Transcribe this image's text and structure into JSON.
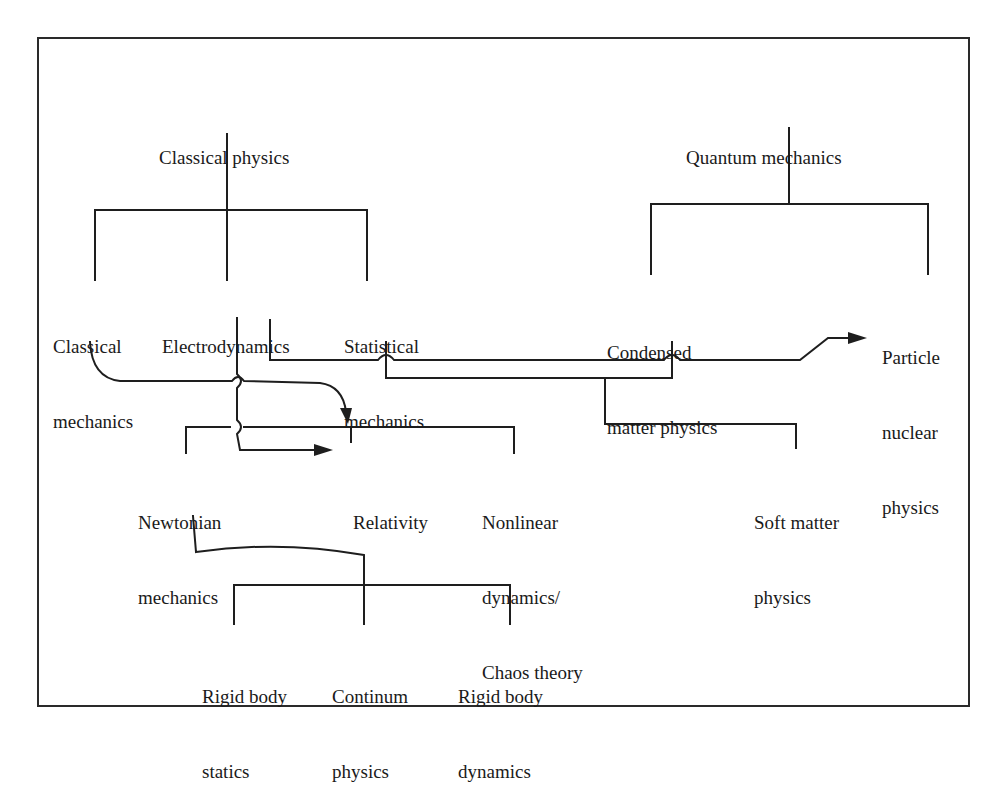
{
  "diagram": {
    "title": "",
    "nodes": {
      "classical_physics": {
        "lines": [
          "Classical physics"
        ]
      },
      "quantum_mechanics": {
        "lines": [
          "Quantum mechanics"
        ]
      },
      "classical_mechanics": {
        "lines": [
          "Classical",
          "mechanics"
        ]
      },
      "electrodynamics": {
        "lines": [
          "Electrodynamics"
        ]
      },
      "statistical_mechanics": {
        "lines": [
          "Statistical",
          "mechanics"
        ]
      },
      "condensed_matter_physics": {
        "lines": [
          "Condensed",
          "matter physics"
        ]
      },
      "particle_nuclear_physics": {
        "lines": [
          "Particle",
          "nuclear",
          "physics"
        ]
      },
      "newtonian_mechanics": {
        "lines": [
          "Newtonian",
          "mechanics"
        ]
      },
      "relativity": {
        "lines": [
          "Relativity"
        ]
      },
      "nonlinear_dynamics": {
        "lines": [
          "Nonlinear",
          "dynamics/",
          "Chaos theory"
        ]
      },
      "soft_matter_physics": {
        "lines": [
          "Soft matter",
          "physics"
        ]
      },
      "rigid_body_statics": {
        "lines": [
          "Rigid body",
          "statics"
        ]
      },
      "continum_physics": {
        "lines": [
          "Continum",
          "physics"
        ]
      },
      "rigid_body_dynamics": {
        "lines": [
          "Rigid body",
          "dynamics"
        ]
      }
    },
    "edges": [
      {
        "from": "Classical physics",
        "to": "Classical mechanics",
        "type": "tree"
      },
      {
        "from": "Classical physics",
        "to": "Electrodynamics",
        "type": "tree"
      },
      {
        "from": "Classical physics",
        "to": "Statistical mechanics",
        "type": "tree"
      },
      {
        "from": "Quantum mechanics",
        "to": "Condensed matter physics",
        "type": "tree"
      },
      {
        "from": "Quantum mechanics",
        "to": "Particle nuclear physics",
        "type": "tree"
      },
      {
        "from": "Classical mechanics",
        "to": "Relativity",
        "type": "arrow"
      },
      {
        "from": "Electrodynamics",
        "to": "Relativity",
        "type": "arrow"
      },
      {
        "from": "Electrodynamics",
        "to": "Particle nuclear physics",
        "type": "arrow"
      },
      {
        "from": "Statistical mechanics + Condensed matter physics",
        "to": "Soft matter physics",
        "type": "merge"
      },
      {
        "from": "Newtonian mechanics / Relativity / Nonlinear dynamics",
        "to": "group",
        "type": "tree"
      },
      {
        "from": "Newtonian mechanics",
        "to": "Continum physics",
        "type": "link"
      },
      {
        "from": "Continum physics",
        "to": "Rigid body statics",
        "type": "tree"
      },
      {
        "from": "Continum physics",
        "to": "Rigid body dynamics",
        "type": "tree"
      }
    ]
  }
}
